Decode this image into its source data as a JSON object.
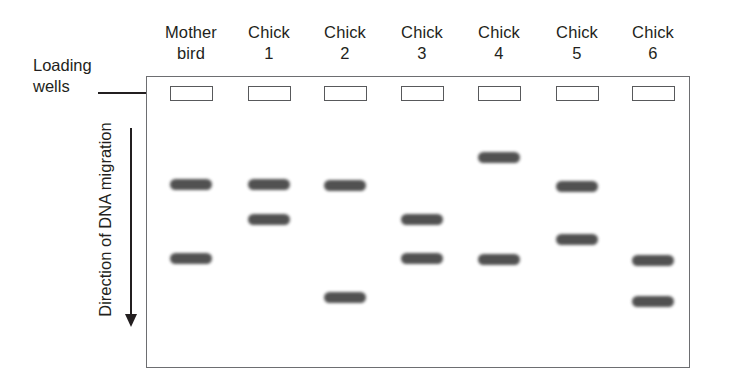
{
  "figure": {
    "type": "gel-electrophoresis-diagram",
    "background_color": "#ffffff",
    "band_color": "#3a3a3a",
    "gel_border_color": "#6d6e71"
  },
  "labels": {
    "loading_wells_line1": "Loading",
    "loading_wells_line2": "wells",
    "migration_direction": "Direction of DNA migration"
  },
  "lanes": [
    {
      "header_line1": "Mother",
      "header_line2": "bird",
      "x": 170,
      "well_y": 86,
      "bands_y": [
        179,
        253
      ]
    },
    {
      "header_line1": "Chick",
      "header_line2": "1",
      "x": 248,
      "well_y": 86,
      "bands_y": [
        179,
        214
      ]
    },
    {
      "header_line1": "Chick",
      "header_line2": "2",
      "x": 324,
      "well_y": 86,
      "bands_y": [
        180,
        292
      ]
    },
    {
      "header_line1": "Chick",
      "header_line2": "3",
      "x": 401,
      "well_y": 86,
      "bands_y": [
        214,
        253
      ]
    },
    {
      "header_line1": "Chick",
      "header_line2": "4",
      "x": 478,
      "well_y": 86,
      "bands_y": [
        152,
        254
      ]
    },
    {
      "header_line1": "Chick",
      "header_line2": "5",
      "x": 556,
      "well_y": 86,
      "bands_y": [
        181,
        234
      ]
    },
    {
      "header_line1": "Chick",
      "header_line2": "6",
      "x": 632,
      "well_y": 86,
      "bands_y": [
        255,
        296
      ]
    }
  ]
}
